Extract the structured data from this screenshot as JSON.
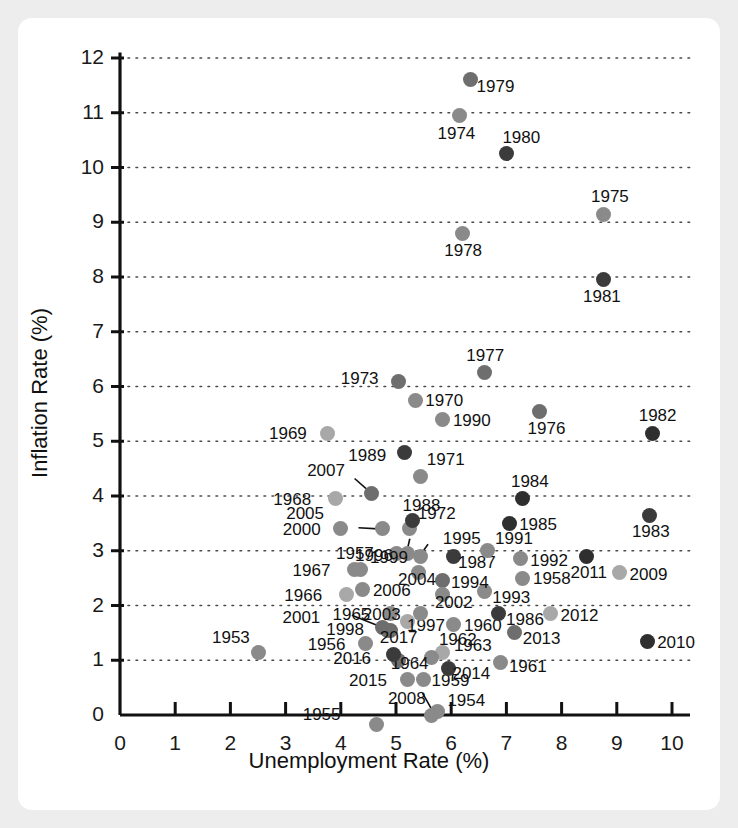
{
  "chart_data": {
    "type": "scatter",
    "title": "",
    "xlabel": "Unemployment Rate (%)",
    "ylabel": "Inflation Rate (%)",
    "xlim": [
      0,
      10.6
    ],
    "ylim": [
      0,
      12.4
    ],
    "xticks": [
      "0",
      "1",
      "2",
      "3",
      "4",
      "5",
      "6",
      "7",
      "8",
      "9",
      "10"
    ],
    "yticks": [
      "0",
      "1",
      "2",
      "3",
      "4",
      "5",
      "6",
      "7",
      "8",
      "9",
      "10",
      "11",
      "12"
    ],
    "grid": "horizontal-dotted",
    "legend": "none",
    "point_label_field": "year",
    "points": [
      {
        "year": "1953",
        "x": 2.5,
        "y": 1.15,
        "shade": "#8a8a8a",
        "lx": -46,
        "ly": -24
      },
      {
        "year": "1954",
        "x": 5.75,
        "y": 0.07,
        "shade": "#8a8a8a",
        "lx": 10,
        "ly": -20
      },
      {
        "year": "1955",
        "x": 4.65,
        "y": -0.18,
        "shade": "#8a8a8a",
        "lx": -74,
        "ly": -20
      },
      {
        "year": "1956",
        "x": 4.45,
        "y": 1.3,
        "shade": "#8a8a8a",
        "lx": -58,
        "ly": -9
      },
      {
        "year": "1957",
        "x": 5.0,
        "y": 2.95,
        "shade": "#8a8a8a",
        "lx": -60,
        "ly": -9
      },
      {
        "year": "1958",
        "x": 7.3,
        "y": 2.5,
        "shade": "#8a8a8a",
        "lx": 10,
        "ly": -9
      },
      {
        "year": "1959",
        "x": 5.5,
        "y": 0.65,
        "shade": "#8a8a8a",
        "lx": 8,
        "ly": -8
      },
      {
        "year": "1960",
        "x": 6.05,
        "y": 1.65,
        "shade": "#8a8a8a",
        "lx": 10,
        "ly": -9
      },
      {
        "year": "1961",
        "x": 6.9,
        "y": 0.95,
        "shade": "#8a8a8a",
        "lx": 8,
        "ly": -6
      },
      {
        "year": "1962",
        "x": 5.85,
        "y": 1.15,
        "shade": "#a8a8a8",
        "lx": -4,
        "ly": -22
      },
      {
        "year": "1963",
        "x": 5.65,
        "y": 1.05,
        "shade": "#8a8a8a",
        "lx": 22,
        "ly": -22
      },
      {
        "year": "1964",
        "x": 5.05,
        "y": 1.0,
        "shade": "#6e6e6e",
        "lx": -8,
        "ly": -6
      },
      {
        "year": "1965",
        "x": 4.9,
        "y": 1.85,
        "shade": "#8a8a8a",
        "lx": -58,
        "ly": -9
      },
      {
        "year": "1966",
        "x": 4.1,
        "y": 2.2,
        "shade": "#a8a8a8",
        "lx": -62,
        "ly": -9
      },
      {
        "year": "1967",
        "x": 4.25,
        "y": 2.65,
        "shade": "#8a8a8a",
        "lx": -62,
        "ly": -9
      },
      {
        "year": "1968",
        "x": 3.9,
        "y": 3.95,
        "shade": "#a8a8a8",
        "lx": -62,
        "ly": -9
      },
      {
        "year": "1969",
        "x": 3.75,
        "y": 5.15,
        "shade": "#a8a8a8",
        "lx": -58,
        "ly": -9
      },
      {
        "year": "1970",
        "x": 5.35,
        "y": 5.75,
        "shade": "#8a8a8a",
        "lx": 10,
        "ly": -9
      },
      {
        "year": "1971",
        "x": 5.45,
        "y": 4.35,
        "shade": "#8a8a8a",
        "lx": 6,
        "ly": -27
      },
      {
        "year": "1972",
        "x": 5.25,
        "y": 3.4,
        "shade": "#8a8a8a",
        "lx": 8,
        "ly": -25
      },
      {
        "year": "1973",
        "x": 5.05,
        "y": 6.1,
        "shade": "#6e6e6e",
        "lx": -58,
        "ly": -12
      },
      {
        "year": "1974",
        "x": 6.15,
        "y": 10.95,
        "shade": "#8a8a8a",
        "lx": -22,
        "ly": 9
      },
      {
        "year": "1975",
        "x": 8.75,
        "y": 9.15,
        "shade": "#8a8a8a",
        "lx": -12,
        "ly": -27
      },
      {
        "year": "1976",
        "x": 7.6,
        "y": 5.55,
        "shade": "#6e6e6e",
        "lx": -12,
        "ly": 8
      },
      {
        "year": "1977",
        "x": 6.6,
        "y": 6.25,
        "shade": "#6e6e6e",
        "lx": -18,
        "ly": -27
      },
      {
        "year": "1978",
        "x": 6.2,
        "y": 8.8,
        "shade": "#8a8a8a",
        "lx": -18,
        "ly": 8
      },
      {
        "year": "1979",
        "x": 6.35,
        "y": 11.6,
        "shade": "#6e6e6e",
        "lx": 6,
        "ly": -3
      },
      {
        "year": "1980",
        "x": 7.0,
        "y": 10.25,
        "shade": "#3b3b3b",
        "lx": -4,
        "ly": -26
      },
      {
        "year": "1981",
        "x": 8.75,
        "y": 7.95,
        "shade": "#3b3b3b",
        "lx": -20,
        "ly": 7
      },
      {
        "year": "1982",
        "x": 9.65,
        "y": 5.15,
        "shade": "#2f2f2f",
        "lx": -14,
        "ly": -27
      },
      {
        "year": "1983",
        "x": 9.6,
        "y": 3.65,
        "shade": "#3b3b3b",
        "lx": -18,
        "ly": 7
      },
      {
        "year": "1984",
        "x": 7.3,
        "y": 3.95,
        "shade": "#2f2f2f",
        "lx": -12,
        "ly": -27
      },
      {
        "year": "1985",
        "x": 7.05,
        "y": 3.5,
        "shade": "#2f2f2f",
        "lx": 10,
        "ly": -8
      },
      {
        "year": "1986",
        "x": 6.85,
        "y": 1.85,
        "shade": "#3b3b3b",
        "lx": 8,
        "ly": -4
      },
      {
        "year": "1987",
        "x": 6.05,
        "y": 2.9,
        "shade": "#3b3b3b",
        "lx": 4,
        "ly": -3
      },
      {
        "year": "1988",
        "x": 5.3,
        "y": 3.55,
        "shade": "#3b3b3b",
        "lx": -10,
        "ly": -25
      },
      {
        "year": "1989",
        "x": 5.15,
        "y": 4.8,
        "shade": "#3b3b3b",
        "lx": -56,
        "ly": -6
      },
      {
        "year": "1990",
        "x": 5.85,
        "y": 5.4,
        "shade": "#8a8a8a",
        "lx": 10,
        "ly": -8
      },
      {
        "year": "1991",
        "x": 6.65,
        "y": 3.0,
        "shade": "#8a8a8a",
        "lx": 8,
        "ly": -22
      },
      {
        "year": "1992",
        "x": 7.25,
        "y": 2.85,
        "shade": "#8a8a8a",
        "lx": 10,
        "ly": -8
      },
      {
        "year": "1993",
        "x": 6.6,
        "y": 2.25,
        "shade": "#8a8a8a",
        "lx": 8,
        "ly": -4
      },
      {
        "year": "1994",
        "x": 5.85,
        "y": 2.45,
        "shade": "#6e6e6e",
        "lx": 8,
        "ly": -8
      },
      {
        "year": "1995",
        "x": 5.45,
        "y": 2.9,
        "shade": "#8a8a8a",
        "lx": 22,
        "ly": -27
      },
      {
        "year": "1996",
        "x": 5.2,
        "y": 2.95,
        "shade": "#8a8a8a",
        "lx": -52,
        "ly": -7
      },
      {
        "year": "1997",
        "x": 5.2,
        "y": 1.7,
        "shade": "#a8a8a8",
        "lx": 0,
        "ly": -6
      },
      {
        "year": "1998",
        "x": 4.75,
        "y": 1.6,
        "shade": "#6e6e6e",
        "lx": -56,
        "ly": -7
      },
      {
        "year": "1999",
        "x": 4.35,
        "y": 2.65,
        "shade": "#8a8a8a",
        "lx": 10,
        "ly": -22
      },
      {
        "year": "2000",
        "x": 4.0,
        "y": 3.4,
        "shade": "#8a8a8a",
        "lx": -58,
        "ly": -9
      },
      {
        "year": "2001",
        "x": 4.9,
        "y": 1.55,
        "shade": "#6e6e6e",
        "lx": -108,
        "ly": -22
      },
      {
        "year": "2002",
        "x": 5.85,
        "y": 2.2,
        "shade": "#8a8a8a",
        "lx": -8,
        "ly": -2
      },
      {
        "year": "2003",
        "x": 5.45,
        "y": 1.85,
        "shade": "#8a8a8a",
        "lx": -58,
        "ly": -9
      },
      {
        "year": "2004",
        "x": 5.4,
        "y": 2.6,
        "shade": "#8a8a8a",
        "lx": -20,
        "ly": -3
      },
      {
        "year": "2005",
        "x": 4.75,
        "y": 3.4,
        "shade": "#8a8a8a",
        "lx": -96,
        "ly": -25
      },
      {
        "year": "2006",
        "x": 4.4,
        "y": 2.3,
        "shade": "#8a8a8a",
        "lx": 10,
        "ly": -8
      },
      {
        "year": "2007",
        "x": 4.55,
        "y": 4.05,
        "shade": "#6e6e6e",
        "lx": -64,
        "ly": -32
      },
      {
        "year": "2008",
        "x": 5.65,
        "y": 0.0,
        "shade": "#8a8a8a",
        "lx": -44,
        "ly": -26
      },
      {
        "year": "2009",
        "x": 9.05,
        "y": 2.6,
        "shade": "#a8a8a8",
        "lx": 10,
        "ly": -8
      },
      {
        "year": "2010",
        "x": 9.55,
        "y": 1.35,
        "shade": "#2f2f2f",
        "lx": 10,
        "ly": -8
      },
      {
        "year": "2011",
        "x": 8.45,
        "y": 2.9,
        "shade": "#2f2f2f",
        "lx": -16,
        "ly": 7
      },
      {
        "year": "2012",
        "x": 7.8,
        "y": 1.85,
        "shade": "#a8a8a8",
        "lx": 10,
        "ly": -8
      },
      {
        "year": "2013",
        "x": 7.15,
        "y": 1.5,
        "shade": "#6e6e6e",
        "lx": 8,
        "ly": -4
      },
      {
        "year": "2014",
        "x": 5.95,
        "y": 0.85,
        "shade": "#3b3b3b",
        "lx": 4,
        "ly": -4
      },
      {
        "year": "2015",
        "x": 5.2,
        "y": 0.65,
        "shade": "#8a8a8a",
        "lx": -58,
        "ly": -8
      },
      {
        "year": "2016",
        "x": 4.95,
        "y": 1.1,
        "shade": "#3b3b3b",
        "lx": -60,
        "ly": -6
      },
      {
        "year": "2017",
        "x": 4.85,
        "y": 1.55,
        "shade": "#6e6e6e",
        "lx": -8,
        "ly": -2
      }
    ],
    "connector_lines": [
      {
        "from_label": "2007",
        "x1": 4.25,
        "y1": 4.32,
        "x2": 4.5,
        "y2": 4.1
      },
      {
        "from_label": "2005",
        "x1": 4.32,
        "y1": 3.42,
        "x2": 4.68,
        "y2": 3.4
      },
      {
        "from_label": "2001",
        "x1": 4.2,
        "y1": 1.82,
        "x2": 4.85,
        "y2": 1.56
      },
      {
        "from_label": "1995",
        "x1": 5.58,
        "y1": 3.12,
        "x2": 5.46,
        "y2": 2.95
      },
      {
        "from_label": "1996",
        "x1": 5.25,
        "y1": 3.22,
        "x2": 5.2,
        "y2": 3.0
      },
      {
        "from_label": "2008",
        "x1": 5.48,
        "y1": 0.4,
        "x2": 5.66,
        "y2": 0.08
      }
    ]
  },
  "axes": {
    "x_title": "Unemployment Rate (%)",
    "y_title": "Inflation Rate (%)"
  }
}
